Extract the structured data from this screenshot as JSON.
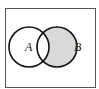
{
  "diagram": {
    "type": "venn",
    "cropped_heading": "",
    "universe": {
      "x": 5,
      "y": 8,
      "width": 91,
      "height": 80,
      "stroke": "#555555"
    },
    "sets": [
      {
        "label": "A",
        "cx": 29,
        "cy": 47,
        "r": 20,
        "label_x": 25,
        "label_y": 51
      },
      {
        "label": "B",
        "cx": 57,
        "cy": 47,
        "r": 20,
        "label_x": 74,
        "label_y": 51
      }
    ],
    "shaded_region": "B - A",
    "shade_color": "#d9d9d9",
    "stroke_color": "#111111"
  }
}
